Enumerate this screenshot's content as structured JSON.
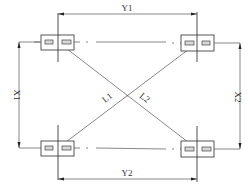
{
  "diagram": {
    "title": "",
    "dimensions": {
      "top": "Y1",
      "bottom": "Y2",
      "left": "X1",
      "right": "X2"
    },
    "diagonals": {
      "first": "L1",
      "second": "L2"
    },
    "nodes": [
      {
        "id": "top-left",
        "label": ""
      },
      {
        "id": "top-right",
        "label": ""
      },
      {
        "id": "bottom-left",
        "label": ""
      },
      {
        "id": "bottom-right",
        "label": ""
      }
    ],
    "colors": {
      "line": "#3a3a3a",
      "pad_fill": "#d8d8d8",
      "background": "#ffffff"
    }
  }
}
